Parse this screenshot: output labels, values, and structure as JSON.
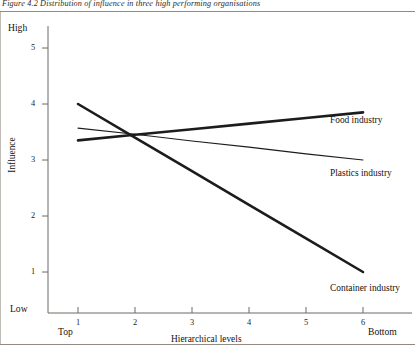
{
  "figure": {
    "caption": "Figure 4.2 Distribution of influence in three high performing organisations"
  },
  "chart_data": {
    "type": "line",
    "title": "Figure 4.2 Distribution of influence in three high performing organisations",
    "xlabel": "Hierarchical levels",
    "ylabel": "Influence",
    "x": [
      1,
      2,
      3,
      4,
      5,
      6
    ],
    "xticklabels": [
      "1",
      "2",
      "3",
      "4",
      "5",
      "6"
    ],
    "xlim": [
      0.6,
      6.5
    ],
    "x_end_labels": {
      "low": "Top",
      "high": "Bottom"
    },
    "yticks": [
      1,
      2,
      3,
      4,
      5
    ],
    "yticklabels": [
      "1",
      "2",
      "3",
      "4",
      "5"
    ],
    "ylim": [
      0.32,
      5.5
    ],
    "y_end_labels": {
      "low": "Low",
      "high": "High"
    },
    "grid": false,
    "legend": "inline-right",
    "series": [
      {
        "name": "Food industry",
        "label": "Food industry",
        "linewidth": "thick",
        "color": "#1c1c1c",
        "values": [
          3.35,
          3.45,
          3.55,
          3.65,
          3.75,
          3.85
        ]
      },
      {
        "name": "Plastics industry",
        "label": "Plastics industry",
        "linewidth": "thin",
        "color": "#1c1c1c",
        "values": [
          3.57,
          3.46,
          3.34,
          3.23,
          3.11,
          3.0
        ]
      },
      {
        "name": "Container industry",
        "label": "Container industry",
        "linewidth": "thick",
        "color": "#1c1c1c",
        "values": [
          4.0,
          3.4,
          2.8,
          2.2,
          1.6,
          1.0
        ]
      }
    ]
  },
  "axes": {
    "y_high": "High",
    "y_low": "Low",
    "y_ticks": [
      "5",
      "4",
      "3",
      "2",
      "1"
    ],
    "y_title": "Influence",
    "x_top": "Top",
    "x_bottom": "Bottom",
    "x_ticks": [
      "1",
      "2",
      "3",
      "4",
      "5",
      "6"
    ],
    "x_title": "Hierarchical levels"
  },
  "series_labels": {
    "food": "Food industry",
    "plastics": "Plastics industry",
    "container": "Container industry"
  }
}
